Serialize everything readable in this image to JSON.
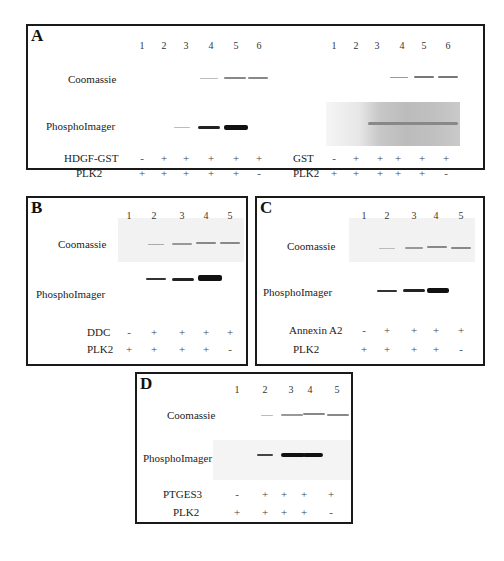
{
  "panels": {
    "A": {
      "letter": "A",
      "left": {
        "lanes": [
          "1",
          "2",
          "3",
          "4",
          "5",
          "6"
        ],
        "row_labels": {
          "coomassie": "Coomassie",
          "phospho": "PhosphoImager"
        },
        "cond1": {
          "label": "HDGF-GST",
          "signs": [
            "-",
            "+",
            "+",
            "+",
            "+",
            "+"
          ]
        },
        "cond2": {
          "label": "PLK2",
          "signs": [
            "+",
            "+",
            "+",
            "+",
            "+",
            "-"
          ]
        }
      },
      "right": {
        "lanes": [
          "1",
          "2",
          "3",
          "4",
          "5",
          "6"
        ],
        "cond1": {
          "label": "GST",
          "signs": [
            "-",
            "+",
            "+",
            "+",
            "+",
            "+"
          ]
        },
        "cond2": {
          "label": "PLK2",
          "signs": [
            "+",
            "+",
            "+",
            "+",
            "+",
            "-"
          ]
        }
      }
    },
    "B": {
      "letter": "B",
      "lanes": [
        "1",
        "2",
        "3",
        "4",
        "5"
      ],
      "row_labels": {
        "coomassie": "Coomassie",
        "phospho": "PhosphoImager"
      },
      "cond1": {
        "label": "DDC",
        "signs": [
          "-",
          "+",
          "+",
          "+",
          "+"
        ]
      },
      "cond2": {
        "label": "PLK2",
        "signs": [
          "+",
          "+",
          "+",
          "+",
          "-"
        ]
      }
    },
    "C": {
      "letter": "C",
      "lanes": [
        "1",
        "2",
        "3",
        "4",
        "5"
      ],
      "row_labels": {
        "coomassie": "Coomassie",
        "phospho": "PhosphoImager"
      },
      "cond1": {
        "label": "Annexin A2",
        "signs": [
          "-",
          "+",
          "+",
          "+",
          "+"
        ]
      },
      "cond2": {
        "label": "PLK2",
        "signs": [
          "+",
          "+",
          "+",
          "+",
          "-"
        ]
      }
    },
    "D": {
      "letter": "D",
      "lanes": [
        "1",
        "2",
        "3",
        "4",
        "5"
      ],
      "row_labels": {
        "coomassie": "Coomassie",
        "phospho": "PhosphoImager"
      },
      "cond1": {
        "label": "PTGES3",
        "signs": [
          "-",
          "+",
          "+",
          "+",
          "+"
        ]
      },
      "cond2": {
        "label": "PLK2",
        "signs": [
          "+",
          "+",
          "+",
          "+",
          "-"
        ]
      }
    }
  }
}
